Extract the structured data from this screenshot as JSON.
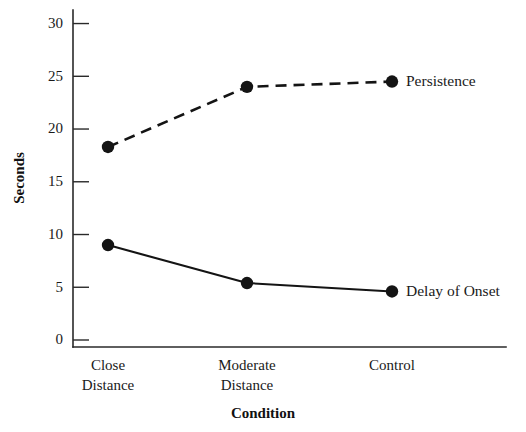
{
  "chart_data": {
    "type": "line",
    "title": "",
    "xlabel": "Condition",
    "ylabel": "Seconds",
    "categories": [
      "Close Distance",
      "Moderate Distance",
      "Control"
    ],
    "category_lines": [
      [
        "Close",
        "Distance"
      ],
      [
        "Moderate",
        "Distance"
      ],
      [
        "Control"
      ]
    ],
    "ylim": [
      0,
      31
    ],
    "yticks": [
      0,
      5,
      10,
      15,
      20,
      25,
      30
    ],
    "ytick_labels": [
      "0",
      "5",
      "10",
      "15",
      "20",
      "25",
      "30"
    ],
    "grid": false,
    "legend_position": "right-inline",
    "series": [
      {
        "name": "Persistence",
        "style": "dashed",
        "marker": "filled-circle",
        "color": "#141414",
        "values": [
          18.3,
          24.0,
          24.5
        ]
      },
      {
        "name": "Delay of Onset",
        "style": "solid",
        "marker": "filled-circle",
        "color": "#141414",
        "values": [
          9.0,
          5.4,
          4.6
        ]
      }
    ],
    "annotations": [
      {
        "text": "Persistence",
        "attached_to": "Persistence",
        "at_category": "Control"
      },
      {
        "text": "Delay of Onset",
        "attached_to": "Delay of Onset",
        "at_category": "Control"
      }
    ]
  },
  "axes": {
    "y_axis_title": "Seconds",
    "x_axis_title": "Condition"
  }
}
